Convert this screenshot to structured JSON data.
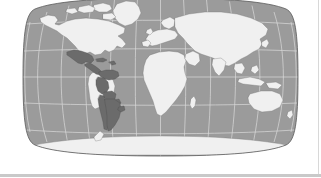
{
  "figure": {
    "kind": "world-map",
    "projection": "Robinson",
    "background_color": "#ffffff",
    "title": "",
    "caption": ""
  },
  "map": {
    "ocean_color": "#9b9b9b",
    "land_color": "#f0f0f0",
    "highlight_color": "#6b6b6b",
    "border_color": "#7a7a7a",
    "coast_color": "#6e6e6e",
    "graticule_color": "#e6e6e6",
    "outline_color": "#5a5a5a",
    "graticule": {
      "visible": true,
      "meridian_spacing_deg": 30,
      "parallel_spacing_deg": 30,
      "meridians": [
        -180,
        -150,
        -120,
        -90,
        -60,
        -30,
        0,
        30,
        60,
        90,
        120,
        150,
        180
      ],
      "parallels": [
        -60,
        -30,
        0,
        30,
        60
      ]
    },
    "legend": {
      "visible": false,
      "entries": [
        {
          "label": "Highlighted",
          "color": "#6b6b6b"
        },
        {
          "label": "Other land",
          "color": "#f0f0f0"
        },
        {
          "label": "Ocean",
          "color": "#9b9b9b"
        }
      ]
    },
    "highlighted_regions": [
      "Mexico",
      "Guatemala",
      "Belize",
      "Honduras",
      "El Salvador",
      "Nicaragua",
      "Costa Rica",
      "Panama",
      "Cuba",
      "Dominican Republic",
      "Colombia",
      "Venezuela",
      "Ecuador",
      "Peru",
      "Bolivia",
      "Chile",
      "Paraguay",
      "Uruguay",
      "Argentina"
    ],
    "unhighlighted_regions": [
      "United States",
      "Canada",
      "Greenland",
      "Brazil",
      "Europe",
      "Africa",
      "Asia",
      "Australia",
      "Antarctica"
    ]
  },
  "decor": {
    "bottom_rule_color": "#c9c9c9",
    "right_rule_color": "#d8d8d8"
  }
}
